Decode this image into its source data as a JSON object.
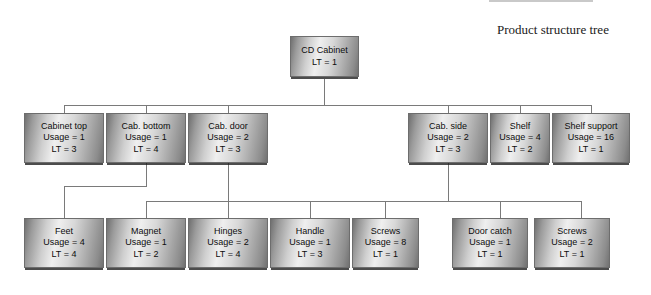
{
  "figure": {
    "banner_label": "FIGURE 14-4",
    "caption": "Product structure tree"
  },
  "diagram": {
    "type": "product-structure-tree",
    "labels": {
      "usage_prefix": "Usage = ",
      "lt_prefix": "LT = "
    },
    "levels": [
      {
        "level": 0,
        "nodes": [
          {
            "id": "cd-cabinet",
            "title": "CD Cabinet",
            "usage": null,
            "usage_text": "",
            "lt_text": "LT = 1",
            "lt": 1
          }
        ]
      },
      {
        "level": 1,
        "nodes": [
          {
            "id": "cabinet-top",
            "title": "Cabinet top",
            "usage": 1,
            "usage_text": "Usage = 1",
            "lt_text": "LT = 3",
            "lt": 3
          },
          {
            "id": "cab-bottom",
            "title": "Cab. bottom",
            "usage": 1,
            "usage_text": "Usage = 1",
            "lt_text": "LT = 4",
            "lt": 4
          },
          {
            "id": "cab-door",
            "title": "Cab. door",
            "usage": 2,
            "usage_text": "Usage = 2",
            "lt_text": "LT = 3",
            "lt": 3
          },
          {
            "id": "cab-side",
            "title": "Cab. side",
            "usage": 2,
            "usage_text": "Usage = 2",
            "lt_text": "LT = 3",
            "lt": 3
          },
          {
            "id": "shelf",
            "title": "Shelf",
            "usage": 4,
            "usage_text": "Usage = 4",
            "lt_text": "LT = 2",
            "lt": 2
          },
          {
            "id": "shelf-support",
            "title": "Shelf support",
            "usage": 16,
            "usage_text": "Usage = 16",
            "lt_text": "LT = 1",
            "lt": 1
          }
        ]
      },
      {
        "level": 2,
        "nodes": [
          {
            "id": "feet",
            "title": "Feet",
            "usage": 4,
            "usage_text": "Usage = 4",
            "lt_text": "LT = 4",
            "lt": 4,
            "parent": "cab-bottom"
          },
          {
            "id": "magnet",
            "title": "Magnet",
            "usage": 1,
            "usage_text": "Usage = 1",
            "lt_text": "LT = 2",
            "lt": 2,
            "parent": "cab-door"
          },
          {
            "id": "hinges",
            "title": "Hinges",
            "usage": 2,
            "usage_text": "Usage = 2",
            "lt_text": "LT = 4",
            "lt": 4,
            "parent": "cab-door"
          },
          {
            "id": "handle",
            "title": "Handle",
            "usage": 1,
            "usage_text": "Usage = 1",
            "lt_text": "LT = 3",
            "lt": 3,
            "parent": "cab-door"
          },
          {
            "id": "screws-door",
            "title": "Screws",
            "usage": 8,
            "usage_text": "Usage = 8",
            "lt_text": "LT = 1",
            "lt": 1,
            "parent": "cab-door"
          },
          {
            "id": "door-catch",
            "title": "Door catch",
            "usage": 1,
            "usage_text": "Usage = 1",
            "lt_text": "LT = 1",
            "lt": 1,
            "parent": "cab-side"
          },
          {
            "id": "screws-side",
            "title": "Screws",
            "usage": 2,
            "usage_text": "Usage = 2",
            "lt_text": "LT = 1",
            "lt": 1,
            "parent": "cab-side"
          }
        ]
      }
    ],
    "colors": {
      "node_border": "#6d6d6d",
      "node_light": "#efefef",
      "node_dark": "#6f6f6f",
      "connector": "#7a7a7a",
      "text": "#0d0d0d",
      "banner_bg": "#c9c9c9"
    }
  }
}
